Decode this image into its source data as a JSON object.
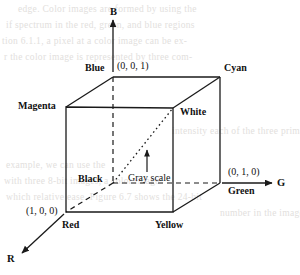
{
  "figure": {
    "type": "rgb-color-cube-diagram",
    "axes": [
      {
        "name": "B",
        "label": "B",
        "direction": "up"
      },
      {
        "name": "G",
        "label": "G",
        "direction": "right"
      },
      {
        "name": "R",
        "label": "R",
        "direction": "down-left"
      }
    ],
    "vertices": [
      {
        "name": "blue",
        "label": "Blue",
        "coord": "(0, 0, 1)"
      },
      {
        "name": "cyan",
        "label": "Cyan",
        "coord": ""
      },
      {
        "name": "magenta",
        "label": "Magenta",
        "coord": ""
      },
      {
        "name": "white",
        "label": "White",
        "coord": ""
      },
      {
        "name": "black",
        "label": "Black",
        "coord": ""
      },
      {
        "name": "green",
        "label": "Green",
        "coord": "(0, 1, 0)"
      },
      {
        "name": "red",
        "label": "Red",
        "coord": "(1, 0, 0)"
      },
      {
        "name": "yellow",
        "label": "Yellow",
        "coord": ""
      }
    ],
    "annotations": [
      {
        "name": "gray-scale",
        "label": "Gray scale"
      }
    ],
    "labels": {
      "blue": "Blue",
      "blue_coord": "(0, 0, 1)",
      "cyan": "Cyan",
      "magenta": "Magenta",
      "white": "White",
      "black": "Black",
      "green": "Green",
      "green_coord": "(0, 1, 0)",
      "red": "Red",
      "red_coord": "(1, 0, 0)",
      "yellow": "Yellow",
      "gray_scale": "Gray scale",
      "axis_b": "B",
      "axis_g": "G",
      "axis_r": "R"
    },
    "colors": {
      "line": "#1a1a1a",
      "background": "#ffffff",
      "bleed_text": "#e2e0dd"
    }
  },
  "bleed": {
    "lines": [
      "edge. Color images are formed by using the",
      "if spectrum in the red, green, and blue regions",
      "tion 6.1.1, a pixel at a color image can be ex-",
      "r the color image is represented by three com-",
      "intensity each of the three primary images at a",
      "example, we can use the",
      "with three 8-bit images, a color image",
      "which relative ease. Figure 6.7 shows the 24-bit",
      "number in the image can be in"
    ]
  }
}
